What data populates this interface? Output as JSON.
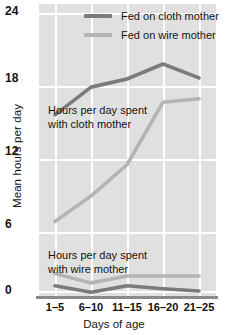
{
  "chart_data": {
    "type": "line",
    "title": "",
    "xlabel": "Days of age",
    "ylabel": "Mean hours per day",
    "categories": [
      "1–5",
      "6–10",
      "11–15",
      "16–20",
      "21–25"
    ],
    "ylim": [
      0,
      24
    ],
    "yticks": [
      0,
      6,
      12,
      18,
      24
    ],
    "ytick_labels": [
      "0",
      "6",
      "12",
      "18",
      "24"
    ],
    "grid": true,
    "legend_position": "top-right",
    "series": [
      {
        "name": "Fed on cloth mother",
        "color": "#7b7b7b",
        "group": "time-with-cloth-mother",
        "values": [
          15.2,
          17.6,
          18.3,
          19.6,
          18.4
        ]
      },
      {
        "name": "Fed on wire mother",
        "color": "#b4b4b4",
        "group": "time-with-cloth-mother",
        "values": [
          6.0,
          8.2,
          10.9,
          16.3,
          16.6
        ]
      },
      {
        "name": "Fed on wire mother",
        "color": "#b4b4b4",
        "group": "time-with-wire-mother",
        "values": [
          1.5,
          0.7,
          1.3,
          1.3,
          1.3
        ]
      },
      {
        "name": "Fed on cloth mother",
        "color": "#7b7b7b",
        "group": "time-with-wire-mother",
        "values": [
          0.45,
          -0.1,
          0.45,
          0.2,
          0.0
        ]
      }
    ],
    "annotations": [
      {
        "text_line1": "Hours per day spent",
        "text_line2": "with cloth mother"
      },
      {
        "text_line1": "Hours per day spent",
        "text_line2": "with wire mother"
      }
    ]
  },
  "legend": {
    "items": [
      {
        "label": "Fed on cloth mother",
        "color": "#7b7b7b"
      },
      {
        "label": "Fed on wire mother",
        "color": "#b4b4b4"
      }
    ]
  },
  "axes": {
    "y_title": "Mean hours per day",
    "x_title": "Days of age",
    "y_ticks": [
      "24",
      "18",
      "12",
      "6",
      "0"
    ],
    "x_ticks": [
      "1–5",
      "6–10",
      "11–15",
      "16–20",
      "21–25"
    ]
  },
  "annotations": {
    "cloth": {
      "line1": "Hours per day spent",
      "line2": "with cloth mother"
    },
    "wire": {
      "line1": "Hours per day spent",
      "line2": "with wire mother"
    }
  },
  "colors": {
    "plot_background": "#e0e0e0",
    "grid": "#ffffff",
    "cloth_series": "#7b7b7b",
    "wire_series": "#b4b4b4",
    "axis": "#8a8a8a",
    "text": "#141414"
  }
}
